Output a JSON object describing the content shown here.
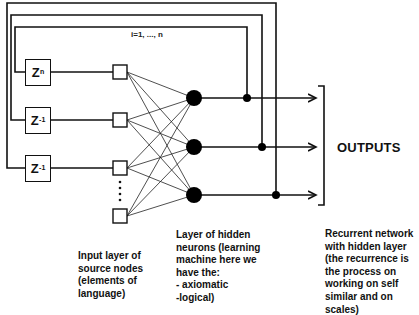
{
  "diagram": {
    "delay_units": [
      {
        "base": "Z",
        "exponent": "n"
      },
      {
        "base": "Z",
        "exponent": "-1"
      },
      {
        "base": "Z",
        "exponent": "-1"
      }
    ],
    "iteration_label": "i=1, ..., n",
    "outputs_label": "OUTPUTS",
    "input_nodes_count": 4,
    "hidden_nodes_count": 3,
    "ellipsis": "⋮",
    "captions": {
      "input_layer": [
        "Input layer of",
        "source nodes",
        "(elements of",
        "language)"
      ],
      "hidden_layer": [
        "Layer of hidden",
        "neurons (learning",
        "machine here we",
        "have the:",
        "- axiomatic",
        "-logical)"
      ],
      "recurrent": [
        "Recurrent network",
        "with hidden layer",
        "(the recurrence is",
        "the process on",
        "working on self",
        "similar and on",
        "scales)"
      ]
    },
    "colors": {
      "line": "#111111",
      "background": "#ffffff"
    }
  }
}
